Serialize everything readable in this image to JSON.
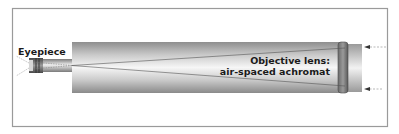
{
  "diagram": {
    "type": "refracting-telescope-cross-section",
    "labels": {
      "eyepiece": "Eyepiece",
      "objective_line1": "Objective lens:",
      "objective_line2": "air-spaced achromat"
    },
    "components": [
      "eyepiece",
      "focuser-drawtube",
      "main-tube",
      "objective-lens",
      "dew-shield"
    ],
    "light_rays": {
      "incoming_arrows": 2,
      "direction": "right-to-left"
    },
    "colors": {
      "frame": "#9a9a9a",
      "tube_dark": "#8c8c8c",
      "tube_light": "#f4f4f4",
      "lens_dark": "#5e5e5e",
      "ray": "#555555",
      "text": "#1a1a1a"
    }
  }
}
